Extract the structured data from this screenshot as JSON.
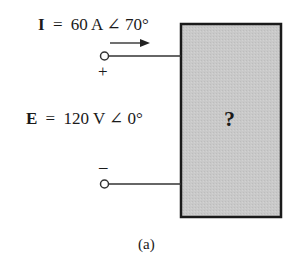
{
  "diagram": {
    "current": {
      "symbol": "I",
      "equals": "=",
      "value": "60 A ∠ 70°"
    },
    "voltage": {
      "symbol": "E",
      "equals": "=",
      "value": "120 V ∠ 0°"
    },
    "polarity": {
      "plus": "+",
      "minus": "–"
    },
    "unknown_block": {
      "label": "?",
      "fill": "#c8c8c8",
      "border": "#1a1a1a"
    },
    "caption": "(a)"
  }
}
